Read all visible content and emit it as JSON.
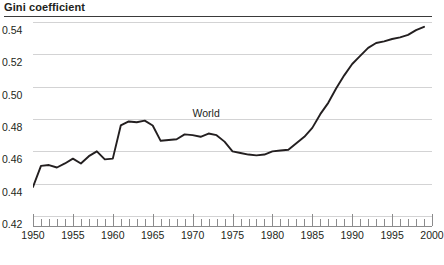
{
  "chart_data": {
    "type": "line",
    "title": "Gini coefficient",
    "xlabel": "",
    "ylabel": "Gini coefficient",
    "xlim": [
      1950,
      2000
    ],
    "ylim": [
      0.42,
      0.54
    ],
    "grid": true,
    "legend_position": "inline-annotation",
    "y_ticks": [
      "0.54",
      "0.52",
      "0.50",
      "0.48",
      "0.46",
      "0.44",
      "0.42"
    ],
    "y_tick_values": [
      0.54,
      0.52,
      0.5,
      0.48,
      0.46,
      0.44,
      0.42
    ],
    "x_ticks": [
      "1950",
      "1955",
      "1960",
      "1965",
      "1970",
      "1975",
      "1980",
      "1985",
      "1990",
      "1995",
      "2000"
    ],
    "x_tick_values": [
      1950,
      1955,
      1960,
      1965,
      1970,
      1975,
      1980,
      1985,
      1990,
      1995,
      2000
    ],
    "minor_tick_interval": 1,
    "annotations": [
      {
        "text": "World",
        "x": 1972,
        "y": 0.4785
      }
    ],
    "series": [
      {
        "name": "World",
        "color": "#231f20",
        "x": [
          1950,
          1951,
          1952,
          1953,
          1954,
          1955,
          1956,
          1957,
          1958,
          1959,
          1960,
          1961,
          1962,
          1963,
          1964,
          1965,
          1966,
          1967,
          1968,
          1969,
          1970,
          1971,
          1972,
          1973,
          1974,
          1975,
          1976,
          1977,
          1978,
          1979,
          1980,
          1981,
          1982,
          1983,
          1984,
          1985,
          1986,
          1987,
          1988,
          1989,
          1990,
          1991,
          1992,
          1993,
          1994,
          1995,
          1996,
          1997,
          1998,
          1999
        ],
        "values": [
          0.438,
          0.451,
          0.4515,
          0.45,
          0.4525,
          0.4555,
          0.4525,
          0.457,
          0.46,
          0.455,
          0.4555,
          0.476,
          0.4785,
          0.478,
          0.479,
          0.476,
          0.4665,
          0.467,
          0.4675,
          0.4705,
          0.47,
          0.469,
          0.471,
          0.47,
          0.466,
          0.46,
          0.459,
          0.458,
          0.4575,
          0.458,
          0.46,
          0.4605,
          0.461,
          0.465,
          0.469,
          0.4745,
          0.483,
          0.49,
          0.499,
          0.507,
          0.514,
          0.519,
          0.524,
          0.527,
          0.528,
          0.5295,
          0.5305,
          0.532,
          0.535,
          0.537
        ]
      }
    ]
  },
  "footer": {
    "cutoff_text": ""
  }
}
